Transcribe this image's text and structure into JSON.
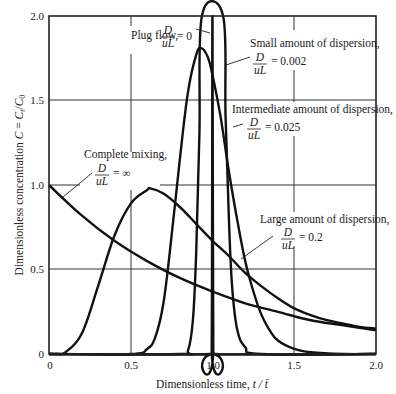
{
  "chart_data": {
    "type": "line",
    "title": "",
    "xlabel": "Dimensionless time, t/t̄",
    "ylabel": "Dimensionless concentration C = Ct/C0",
    "xlim": [
      0,
      2.0
    ],
    "ylim": [
      0,
      2.0
    ],
    "grid": true,
    "x_ticks": [
      "0",
      "0.5",
      "1.0",
      "1.5",
      "2.0"
    ],
    "y_ticks": [
      "0",
      "0.5",
      "1.0",
      "1.5",
      "2.0"
    ],
    "series": [
      {
        "name": "Plug flow, D/uL = 0",
        "dispersion": 0,
        "peak_x": 1.0,
        "peak_y": "off-scale",
        "points": [
          [
            0,
            0
          ],
          [
            0.98,
            0
          ],
          [
            0.995,
            0.05
          ],
          [
            1.0,
            2.0
          ],
          [
            1.005,
            0.05
          ],
          [
            1.02,
            0
          ],
          [
            2.0,
            0
          ]
        ]
      },
      {
        "name": "Small amount of dispersion, D/uL = 0.002",
        "dispersion": 0.002,
        "peak_x": 1.0,
        "peak_y": "off-scale",
        "points": [
          [
            0,
            0
          ],
          [
            0.8,
            0
          ],
          [
            0.85,
            0.02
          ],
          [
            0.88,
            0.2
          ],
          [
            0.9,
            0.6
          ],
          [
            0.92,
            1.3
          ],
          [
            0.935,
            2.0
          ],
          [
            1.065,
            2.0
          ],
          [
            1.08,
            1.4
          ],
          [
            1.1,
            0.8
          ],
          [
            1.12,
            0.4
          ],
          [
            1.15,
            0.15
          ],
          [
            1.2,
            0.04
          ],
          [
            1.3,
            0
          ],
          [
            2.0,
            0
          ]
        ]
      },
      {
        "name": "Intermediate amount of dispersion, D/uL = 0.025",
        "dispersion": 0.025,
        "points": [
          [
            0,
            0
          ],
          [
            0.5,
            0
          ],
          [
            0.6,
            0.03
          ],
          [
            0.65,
            0.1
          ],
          [
            0.7,
            0.3
          ],
          [
            0.75,
            0.7
          ],
          [
            0.8,
            1.15
          ],
          [
            0.85,
            1.55
          ],
          [
            0.9,
            1.77
          ],
          [
            0.93,
            1.81
          ],
          [
            0.97,
            1.76
          ],
          [
            1.0,
            1.65
          ],
          [
            1.05,
            1.4
          ],
          [
            1.1,
            1.08
          ],
          [
            1.15,
            0.8
          ],
          [
            1.2,
            0.55
          ],
          [
            1.25,
            0.37
          ],
          [
            1.3,
            0.23
          ],
          [
            1.35,
            0.14
          ],
          [
            1.4,
            0.08
          ],
          [
            1.5,
            0.03
          ],
          [
            1.6,
            0.01
          ],
          [
            1.8,
            0
          ],
          [
            2.0,
            0
          ]
        ]
      },
      {
        "name": "Large amount of dispersion, D/uL = 0.2",
        "dispersion": 0.2,
        "points": [
          [
            0,
            0
          ],
          [
            0.05,
            0
          ],
          [
            0.1,
            0.01
          ],
          [
            0.2,
            0.12
          ],
          [
            0.3,
            0.4
          ],
          [
            0.4,
            0.7
          ],
          [
            0.5,
            0.89
          ],
          [
            0.6,
            0.97
          ],
          [
            0.62,
            0.98
          ],
          [
            0.7,
            0.95
          ],
          [
            0.8,
            0.87
          ],
          [
            0.9,
            0.77
          ],
          [
            1.0,
            0.67
          ],
          [
            1.1,
            0.58
          ],
          [
            1.2,
            0.48
          ],
          [
            1.3,
            0.4
          ],
          [
            1.4,
            0.33
          ],
          [
            1.5,
            0.27
          ],
          [
            1.6,
            0.23
          ],
          [
            1.7,
            0.2
          ],
          [
            1.8,
            0.18
          ],
          [
            1.9,
            0.16
          ],
          [
            2.0,
            0.15
          ]
        ]
      },
      {
        "name": "Complete mixing, D/uL = ∞",
        "dispersion": "infinity",
        "points": [
          [
            0,
            1.0
          ],
          [
            0.2,
            0.82
          ],
          [
            0.4,
            0.67
          ],
          [
            0.6,
            0.55
          ],
          [
            0.8,
            0.45
          ],
          [
            1.0,
            0.37
          ],
          [
            1.2,
            0.3
          ],
          [
            1.4,
            0.25
          ],
          [
            1.6,
            0.2
          ],
          [
            1.8,
            0.17
          ],
          [
            2.0,
            0.14
          ]
        ]
      }
    ],
    "annotations": [
      {
        "text": "Plug flow,",
        "fraction": {
          "num": "D",
          "den": "uL"
        },
        "value": "= 0"
      },
      {
        "text": "Small amount of dispersion,",
        "fraction": {
          "num": "D",
          "den": "uL"
        },
        "value": "= 0.002"
      },
      {
        "text": "Intermediate amount of dispersion,",
        "fraction": {
          "num": "D",
          "den": "uL"
        },
        "value": "= 0.025"
      },
      {
        "text": "Complete mixing,",
        "fraction": {
          "num": "D",
          "den": "uL"
        },
        "value": "= ∞"
      },
      {
        "text": "Large amount of dispersion,",
        "fraction": {
          "num": "D",
          "den": "uL"
        },
        "value": "= 0.2"
      }
    ]
  },
  "labels": {
    "xlabel_main": "Dimensionless time, ",
    "xlabel_var": "t / t̄",
    "ylabel_main": "Dimensionless concentration ",
    "ylabel_var": "C = Ct/C0",
    "plug": "Plug flow,",
    "plug_val": "= 0",
    "small": "Small amount of dispersion,",
    "small_val": "= 0.002",
    "inter": "Intermediate amount of dispersion,",
    "inter_val": "= 0.025",
    "complete": "Complete mixing,",
    "complete_val": "= ∞",
    "large": "Large amount of dispersion,",
    "large_val": "= 0.2",
    "num": "D",
    "den": "uL"
  }
}
